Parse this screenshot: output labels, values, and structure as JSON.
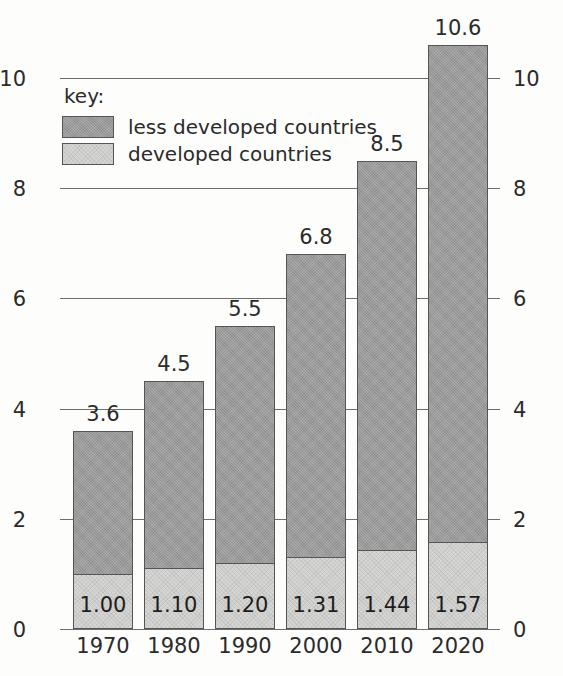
{
  "chart_data": {
    "type": "bar",
    "subtype": "stacked",
    "title": "",
    "xlabel": "",
    "ylabel": "",
    "categories": [
      "1970",
      "1980",
      "1990",
      "2000",
      "2010",
      "2020"
    ],
    "series": [
      {
        "name": "developed countries",
        "color": "#d6d6d4",
        "values": [
          1.0,
          1.1,
          1.2,
          1.31,
          1.44,
          1.57
        ],
        "value_labels": [
          "1.00",
          "1.10",
          "1.20",
          "1.31",
          "1.44",
          "1.57"
        ],
        "label_position": "inside-bottom"
      },
      {
        "name": "less developed countries",
        "color": "#9b9b9b",
        "values": [
          2.6,
          3.4,
          4.3,
          5.49,
          7.06,
          9.03
        ],
        "value_labels": [],
        "label_position": "none"
      }
    ],
    "totals": [
      3.6,
      4.5,
      5.5,
      6.8,
      8.5,
      10.6
    ],
    "total_labels": [
      "3.6",
      "4.5",
      "5.5",
      "6.8",
      "8.5",
      "10.6"
    ],
    "ylim": [
      0,
      10
    ],
    "yticks": [
      0,
      2,
      4,
      6,
      8,
      10
    ],
    "ytick_labels": [
      "0",
      "2",
      "4",
      "6",
      "8",
      "10"
    ],
    "y_axis_both_sides": true,
    "grid": "horizontal",
    "legend_position": "upper-left-inside"
  },
  "legend": {
    "title": "key:",
    "entries": [
      {
        "label": "less developed countries",
        "swatch": "dark"
      },
      {
        "label": "developed countries",
        "swatch": "light"
      }
    ]
  },
  "colors": {
    "bar_dark": "#9b9b9b",
    "bar_light": "#d6d6d4",
    "bar_border": "#555555",
    "gridline": "#6e6e6e",
    "text": "#2b2b2b",
    "background": "#fdfdfc"
  }
}
